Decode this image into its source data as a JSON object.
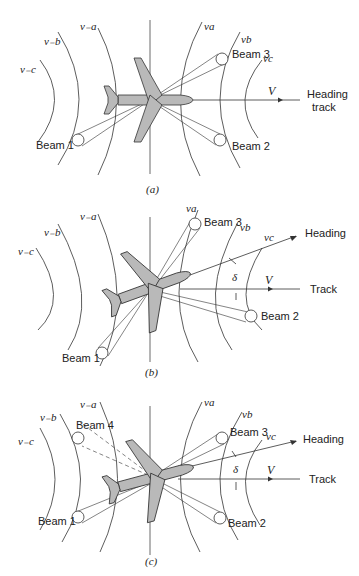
{
  "panels": [
    {
      "caption": "(a)",
      "labels": {
        "nu_neg_c": "ν₋c",
        "nu_neg_b": "ν₋b",
        "nu_neg_a": "ν₋a",
        "nu_a": "νa",
        "nu_b": "νb",
        "nu_c": "νc",
        "beam1": "Beam 1",
        "beam2": "Beam 2",
        "beam3": "Beam 3",
        "velocity": "V",
        "heading": "Heading",
        "track": "track"
      }
    },
    {
      "caption": "(b)",
      "labels": {
        "nu_neg_c": "ν₋c",
        "nu_neg_b": "ν₋b",
        "nu_neg_a": "ν₋a",
        "nu_a": "νa",
        "nu_b": "νb",
        "nu_c": "νc",
        "beam1": "Beam 1",
        "beam2": "Beam 2",
        "beam3": "Beam 3",
        "velocity": "V",
        "heading": "Heading",
        "track": "Track",
        "drift": "δ"
      }
    },
    {
      "caption": "(c)",
      "labels": {
        "nu_neg_c": "ν₋c",
        "nu_neg_b": "ν₋b",
        "nu_neg_a": "ν₋a",
        "nu_a": "νa",
        "nu_b": "νb",
        "nu_c": "νc",
        "beam1": "Beam 1",
        "beam2": "Beam 2",
        "beam3": "Beam 3",
        "beam4": "Beam 4",
        "velocity": "V",
        "heading": "Heading",
        "track": "Track",
        "drift": "δ"
      }
    }
  ]
}
